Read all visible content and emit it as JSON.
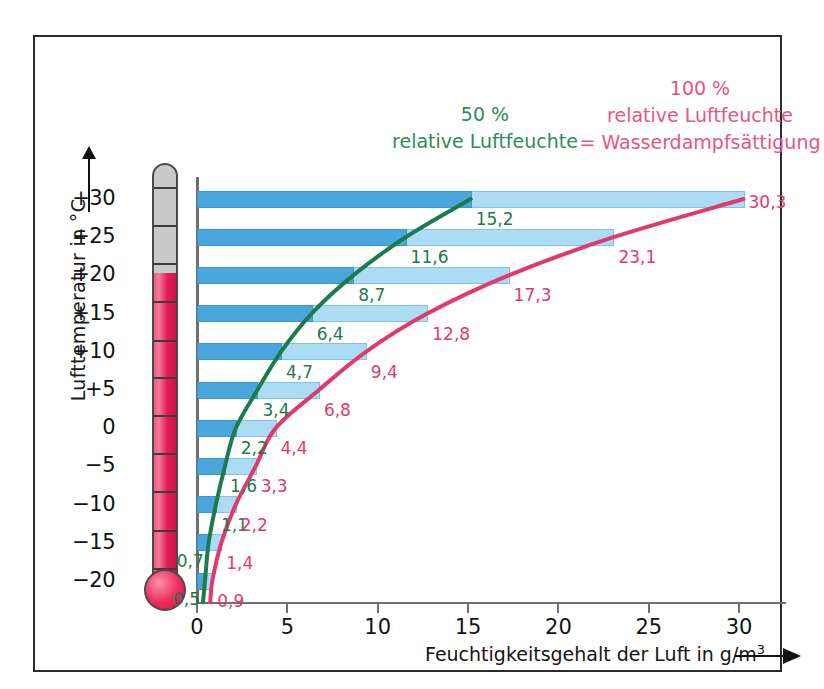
{
  "chart_data": {
    "type": "bar",
    "title": "",
    "xlabel": "Feuchtigkeitsgehalt der Luft in g/m3",
    "ylabel": "Lufttemperatur in °C",
    "xlim": [
      0,
      32
    ],
    "xticks": [
      0,
      5,
      10,
      15,
      20,
      25,
      30
    ],
    "xtick_labels": [
      "0",
      "5",
      "10",
      "15",
      "20",
      "25",
      "30"
    ],
    "ytick_labels": [
      "+30",
      "+25",
      "+20",
      "+15",
      "+10",
      "+5",
      "0",
      "−5",
      "−10",
      "−15",
      "−20"
    ],
    "categories": [
      30,
      25,
      20,
      15,
      10,
      5,
      0,
      -5,
      -10,
      -15,
      -20
    ],
    "grid": false,
    "legend_position": "top",
    "series": [
      {
        "name": "50 % relative Luftfeuchte",
        "color": "#1d7a4a",
        "values": [
          15.2,
          11.6,
          8.7,
          6.4,
          4.7,
          3.4,
          2.2,
          1.6,
          1.1,
          0.7,
          0.5
        ],
        "labels": [
          "15,2",
          "11,6",
          "8,7",
          "6,4",
          "4,7",
          "3,4",
          "2,2",
          "1,6",
          "1,1",
          "0,7",
          "0,5"
        ]
      },
      {
        "name": "100 % relative Luftfeuchte = Wasserdampfsättigung",
        "color": "#e03a6b",
        "values": [
          30.3,
          23.1,
          17.3,
          12.8,
          9.4,
          6.8,
          4.4,
          3.3,
          2.2,
          1.4,
          0.9
        ],
        "labels": [
          "30,3",
          "23,1",
          "17,3",
          "12,8",
          "9,4",
          "6,8",
          "4,4",
          "3,3",
          "2,2",
          "1,4",
          "0,9"
        ]
      }
    ]
  },
  "axes": {
    "y_title": "Lufttemperatur in °C",
    "x_title_main": "Feuchtigkeitsgehalt der Luft in g/m",
    "x_title_sup": "3"
  },
  "legend": {
    "green": {
      "line1": "50 %",
      "line2": "relative Luftfeuchte",
      "color": "#2f8c5a"
    },
    "red": {
      "line1": "100 %",
      "line2": "relative Luftfeuchte",
      "line3": "= Wasserdampfsättigung",
      "color": "#e9557f"
    }
  },
  "colors": {
    "bar_saturated": "#abdcf4",
    "bar_half": "#49a7de",
    "curve_green": "#1d7a4a",
    "curve_red": "#e03a6b",
    "thermometer_red": "#e21e55",
    "thermometer_gray": "#c9c9c9",
    "frame": "#2b2b2b"
  }
}
